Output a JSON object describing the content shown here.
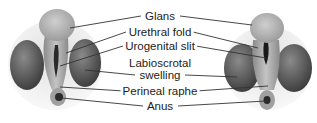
{
  "diagram": {
    "labels": [
      {
        "id": "glans",
        "text": "Glans"
      },
      {
        "id": "urethral-fold",
        "text": "Urethral fold"
      },
      {
        "id": "urogenital-slit",
        "text": "Urogenital slit"
      },
      {
        "id": "labioscrotal-1",
        "text": "Labioscrotal"
      },
      {
        "id": "labioscrotal-2",
        "text": "swelling"
      },
      {
        "id": "perineal-raphe",
        "text": "Perineal raphe"
      },
      {
        "id": "anus",
        "text": "Anus"
      }
    ],
    "colors": {
      "glans": "#b8b8b8",
      "swelling": "#5a5a5a",
      "fold": "#9a9a9a",
      "base": "#cfcfcf",
      "line": "#333333"
    }
  }
}
